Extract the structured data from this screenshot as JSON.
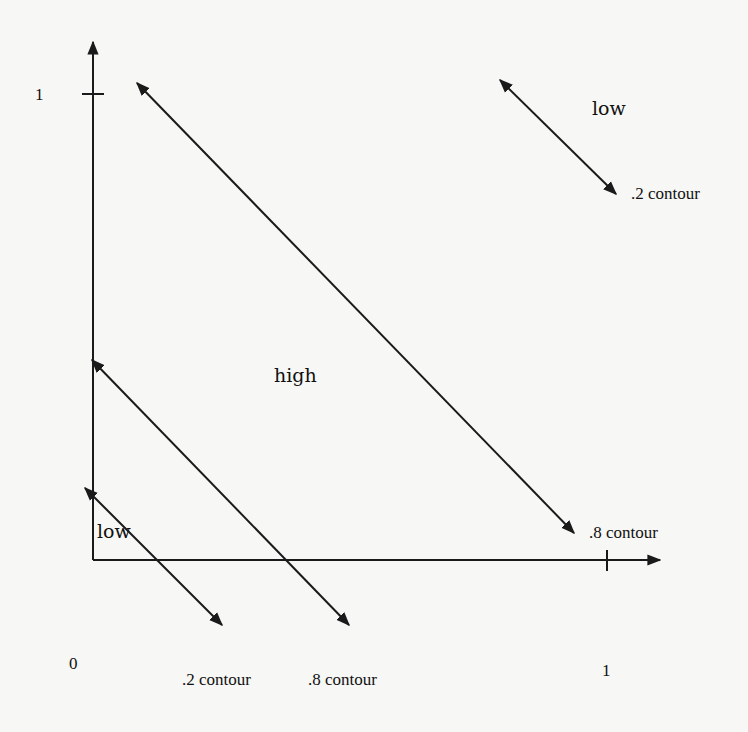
{
  "diagram": {
    "axes": {
      "x_tick_label": "1",
      "y_tick_label": "1",
      "origin_label": "0"
    },
    "regions": [
      {
        "id": "low-lower-left",
        "label": "low"
      },
      {
        "id": "high-middle",
        "label": "high"
      },
      {
        "id": "low-upper-right",
        "label": "low"
      }
    ],
    "contours": [
      {
        "id": "lower-02",
        "label": ".2 contour",
        "level": 0.2,
        "arrow": "both"
      },
      {
        "id": "lower-08",
        "label": ".8 contour",
        "level": 0.8,
        "arrow": "both"
      },
      {
        "id": "upper-08",
        "label": ".8 contour",
        "level": 0.8,
        "arrow": "both"
      },
      {
        "id": "upper-02",
        "label": ".2 contour",
        "level": 0.2,
        "arrow": "both"
      }
    ],
    "colors": {
      "ink": "#1a1a1a",
      "paper": "#f7f7f5"
    }
  }
}
